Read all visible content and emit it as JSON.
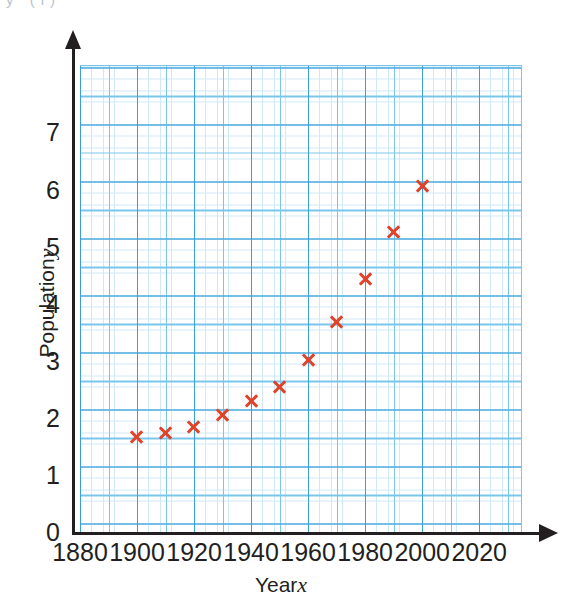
{
  "page": {
    "cropped_heading_fragment": "y   (i)"
  },
  "chart_data": {
    "type": "scatter",
    "title": "",
    "xlabel": "Year",
    "xlabel_variable": "x",
    "ylabel": "Population",
    "ylabel_variable": "y",
    "x": [
      1900,
      1910,
      1920,
      1930,
      1940,
      1950,
      1960,
      1970,
      1980,
      1990,
      2000
    ],
    "values": [
      1.68,
      1.76,
      1.86,
      2.07,
      2.31,
      2.56,
      3.03,
      3.69,
      4.45,
      5.27,
      6.08
    ],
    "series": [
      {
        "name": "Population",
        "marker": "cross",
        "color": "#e1432a",
        "points": [
          {
            "x": 1900,
            "y": 1.68
          },
          {
            "x": 1910,
            "y": 1.76
          },
          {
            "x": 1920,
            "y": 1.86
          },
          {
            "x": 1930,
            "y": 2.07
          },
          {
            "x": 1940,
            "y": 2.31
          },
          {
            "x": 1950,
            "y": 2.56
          },
          {
            "x": 1960,
            "y": 3.03
          },
          {
            "x": 1970,
            "y": 3.69
          },
          {
            "x": 1980,
            "y": 4.45
          },
          {
            "x": 1990,
            "y": 5.27
          },
          {
            "x": 2000,
            "y": 6.08
          }
        ]
      }
    ],
    "xlim": [
      1880,
      2035
    ],
    "ylim": [
      0,
      8.2
    ],
    "xticks": [
      1880,
      1900,
      1920,
      1940,
      1960,
      1980,
      2000,
      2020
    ],
    "xticklabels": [
      "1880",
      "1900",
      "1920",
      "1940",
      "1960",
      "1980",
      "2000",
      "2020"
    ],
    "yticks": [
      0,
      1,
      2,
      3,
      4,
      5,
      6,
      7
    ],
    "yticklabels": [
      "0",
      "1",
      "2",
      "3",
      "4",
      "5",
      "6",
      "7"
    ],
    "grid": true,
    "grid_style": "graph-paper",
    "grid_major_step_x": 20,
    "grid_minor_step_x": 10,
    "grid_fine_step_x": 4,
    "grid_major_step_y": 1,
    "grid_minor_step_y": 0.5,
    "grid_fine_step_y": 0.2,
    "legend": null,
    "legend_position": "none",
    "axis_arrows": true
  },
  "colors": {
    "marker": "#e1432a",
    "grid_major": "#3a9fd8",
    "grid_minor": "#79c6ea",
    "grid_fine": "#cfe9f7",
    "axis": "#231f20",
    "text": "#231f20",
    "background": "#ffffff"
  }
}
